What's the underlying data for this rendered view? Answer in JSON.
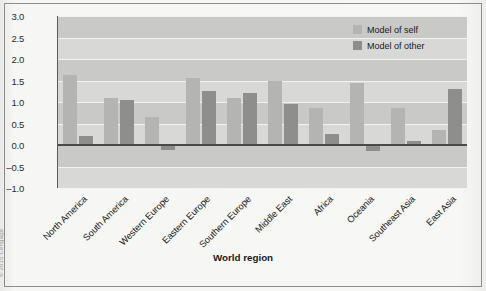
{
  "figure": {
    "credit": "© 2015 Cengage"
  },
  "legend": {
    "position": "top-right",
    "entries": [
      {
        "label": "Model of self",
        "color": "#b4b4b2",
        "swatch": "legend-swatch-self"
      },
      {
        "label": "Model of other",
        "color": "#8e8e8c",
        "swatch": "legend-swatch-other"
      }
    ]
  },
  "chart_data": {
    "type": "bar",
    "title": "",
    "xlabel": "World region",
    "ylabel": "Internal working models",
    "ylim": [
      -1.0,
      3.0
    ],
    "yticks": [
      "3.0",
      "2.5",
      "2.0",
      "1.5",
      "1.0",
      "0.5",
      "0.0",
      "-0.5",
      "-1.0"
    ],
    "ytick_values": [
      3.0,
      2.5,
      2.0,
      1.5,
      1.0,
      0.5,
      0.0,
      -0.5,
      -1.0
    ],
    "grid": true,
    "grid_axis": "y",
    "legend_position": "top-right",
    "categories": [
      "North America",
      "South America",
      "Western Europe",
      "Eastern Europe",
      "Southern Europe",
      "Middle East",
      "Africa",
      "Oceania",
      "Southeast Asia",
      "East Asia"
    ],
    "series": [
      {
        "name": "Model of self",
        "color": "#b4b4b2",
        "values": [
          1.62,
          1.1,
          0.65,
          1.55,
          1.1,
          1.5,
          0.85,
          1.45,
          0.85,
          0.35
        ]
      },
      {
        "name": "Model of other",
        "color": "#8e8e8c",
        "values": [
          0.2,
          1.05,
          -0.12,
          1.25,
          1.2,
          0.95,
          0.25,
          -0.15,
          0.1,
          1.3
        ]
      }
    ]
  }
}
